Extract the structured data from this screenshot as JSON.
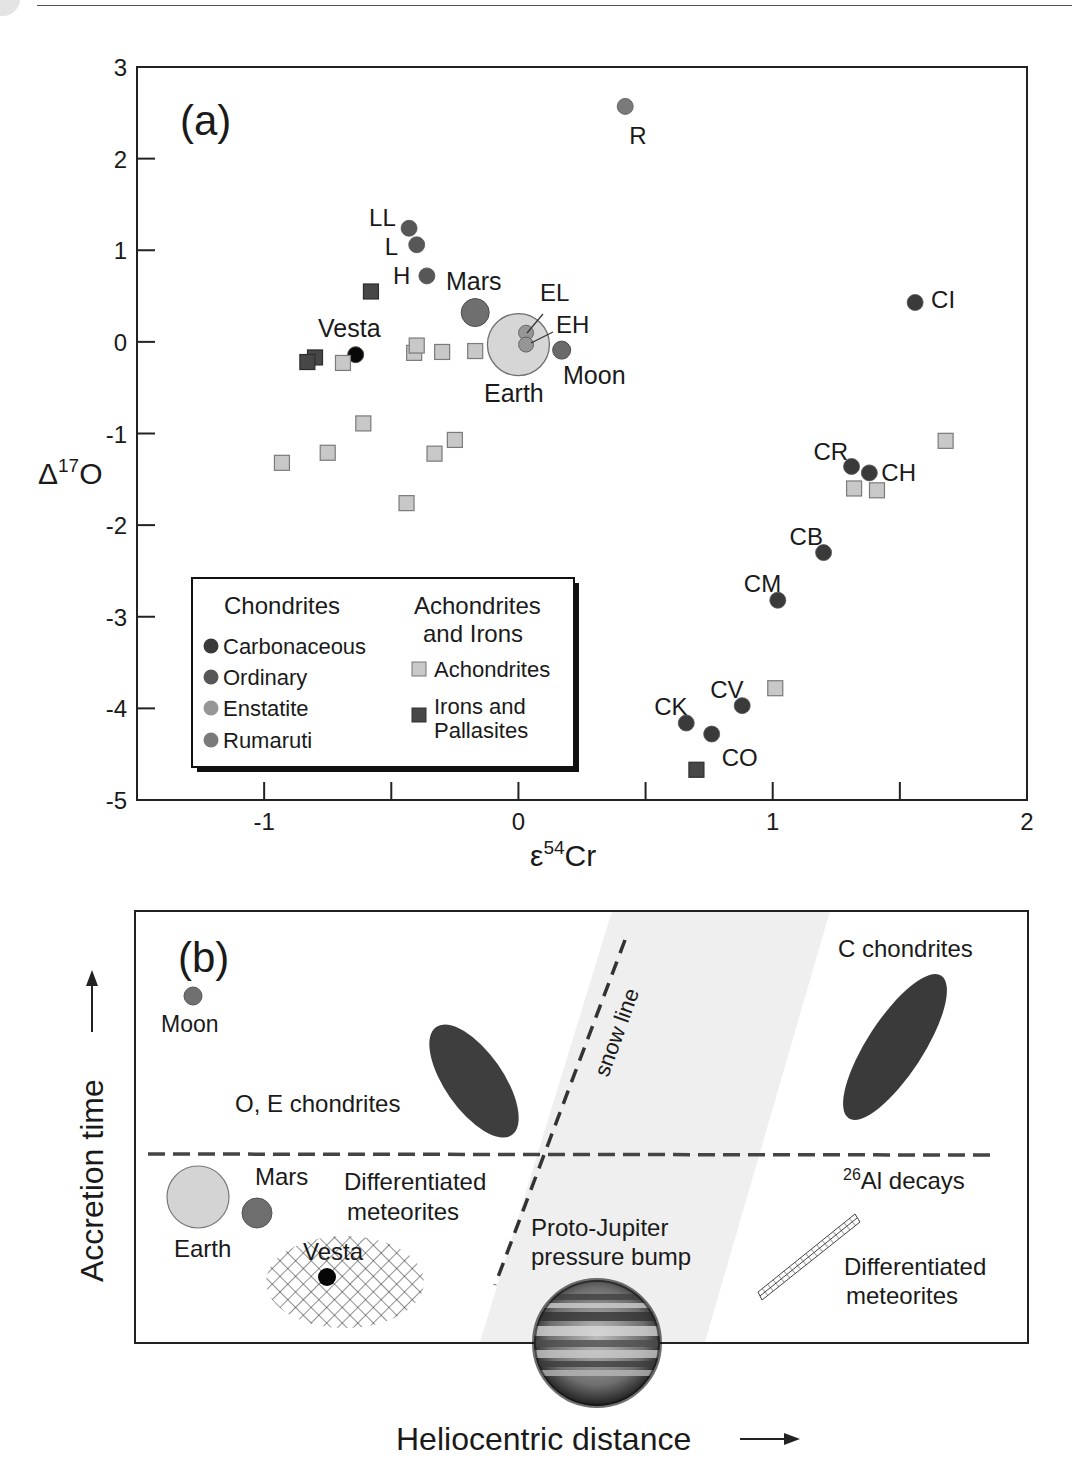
{
  "figure": {
    "panel_a_label": "(a)",
    "panel_b_label": "(b)"
  },
  "chart_data": [
    {
      "type": "scatter",
      "panel": "(a)",
      "title": "",
      "xlabel": "ε54Cr",
      "xlabel_base": "ε",
      "xlabel_sup": "54",
      "xlabel_tail": "Cr",
      "ylabel": "Δ17O",
      "ylabel_base": "Δ",
      "ylabel_sup": "17",
      "ylabel_tail": "O",
      "xlim": [
        -1.5,
        2
      ],
      "ylim": [
        -5,
        3
      ],
      "xticks": [
        -1,
        -0.5,
        0,
        0.5,
        1,
        1.5,
        2
      ],
      "xtick_labels": [
        "-1",
        "",
        "0",
        "",
        "1",
        "",
        "2"
      ],
      "yticks": [
        3,
        2,
        1,
        0,
        -1,
        -2,
        -3,
        -4,
        -5
      ],
      "ytick_labels": [
        "3",
        "2",
        "1",
        "0",
        "-1",
        "-2",
        "-3",
        "-4",
        "-5"
      ],
      "grid": false,
      "legend": {
        "position": "lower-left",
        "col1_title": "Chondrites",
        "col1_items": [
          {
            "label": "Carbonaceous",
            "marker": "circle",
            "color": "#3a3a3a"
          },
          {
            "label": "Ordinary",
            "marker": "circle",
            "color": "#575757"
          },
          {
            "label": "Enstatite",
            "marker": "circle",
            "color": "#969696"
          },
          {
            "label": "Rumaruti",
            "marker": "circle",
            "color": "#7a7a7a"
          }
        ],
        "col2_title_line1": "Achondrites",
        "col2_title_line2": "and Irons",
        "col2_items": [
          {
            "label_line1": "Achondrites",
            "label_line2": "",
            "marker": "square",
            "color": "#c8c8c8"
          },
          {
            "label_line1": "Irons and",
            "label_line2": "Pallasites",
            "marker": "square",
            "color": "#474747"
          }
        ]
      },
      "series": [
        {
          "name": "Carbonaceous",
          "marker": "circle",
          "color": "#3a3a3a",
          "points": [
            {
              "label": "CI",
              "x": 1.56,
              "y": 0.43,
              "lx": 16,
              "ly": -2
            },
            {
              "label": "CR",
              "x": 1.31,
              "y": -1.36,
              "lx": -38,
              "ly": -14
            },
            {
              "label": "CH",
              "x": 1.38,
              "y": -1.43,
              "lx": 12,
              "ly": 0
            },
            {
              "label": "CB",
              "x": 1.2,
              "y": -2.3,
              "lx": -34,
              "ly": -16
            },
            {
              "label": "CM",
              "x": 1.02,
              "y": -2.82,
              "lx": -34,
              "ly": -16
            },
            {
              "label": "CV",
              "x": 0.88,
              "y": -3.97,
              "lx": -32,
              "ly": -16
            },
            {
              "label": "CK",
              "x": 0.66,
              "y": -4.16,
              "lx": -32,
              "ly": -16
            },
            {
              "label": "CO",
              "x": 0.76,
              "y": -4.28,
              "lx": 10,
              "ly": 24
            }
          ]
        },
        {
          "name": "Ordinary",
          "marker": "circle",
          "color": "#575757",
          "points": [
            {
              "label": "LL",
              "x": -0.43,
              "y": 1.24,
              "lx": -40,
              "ly": -10
            },
            {
              "label": "L",
              "x": -0.4,
              "y": 1.06,
              "lx": -32,
              "ly": 2
            },
            {
              "label": "H",
              "x": -0.36,
              "y": 0.72,
              "lx": -34,
              "ly": 0
            }
          ]
        },
        {
          "name": "Enstatite",
          "marker": "circle",
          "color": "#969696",
          "points": [
            {
              "label": "EL",
              "x": 0.03,
              "y": 0.1,
              "lx": 14,
              "ly": -40
            },
            {
              "label": "EH",
              "x": 0.03,
              "y": -0.03,
              "lx": 30,
              "ly": -20
            }
          ]
        },
        {
          "name": "Rumaruti",
          "marker": "circle",
          "color": "#7a7a7a",
          "points": [
            {
              "label": "R",
              "x": 0.42,
              "y": 2.57,
              "lx": 4,
              "ly": 30
            }
          ]
        },
        {
          "name": "Planetary bodies",
          "marker": "circle",
          "points": [
            {
              "label": "Mars",
              "x": -0.17,
              "y": 0.32,
              "r": 14,
              "color": "#6f6f6f"
            },
            {
              "label": "Earth",
              "x": 0.0,
              "y": -0.03,
              "r": 31,
              "color": "#d6d6d6"
            },
            {
              "label": "Moon",
              "x": 0.17,
              "y": -0.09,
              "r": 9,
              "color": "#6a6a6a"
            },
            {
              "label": "Vesta",
              "x": -0.64,
              "y": -0.14,
              "r": 8,
              "color": "#080808"
            }
          ]
        },
        {
          "name": "Achondrites",
          "marker": "square",
          "color": "#c8c8c8",
          "points": [
            {
              "x": -0.69,
              "y": -0.23
            },
            {
              "x": -0.41,
              "y": -0.12
            },
            {
              "x": -0.4,
              "y": -0.04
            },
            {
              "x": -0.3,
              "y": -0.11
            },
            {
              "x": -0.17,
              "y": -0.1
            },
            {
              "x": -0.61,
              "y": -0.89
            },
            {
              "x": -0.93,
              "y": -1.32
            },
            {
              "x": -0.75,
              "y": -1.21
            },
            {
              "x": -0.33,
              "y": -1.22
            },
            {
              "x": -0.25,
              "y": -1.07
            },
            {
              "x": -0.44,
              "y": -1.76
            },
            {
              "x": 1.32,
              "y": -1.6
            },
            {
              "x": 1.41,
              "y": -1.62
            },
            {
              "x": 1.68,
              "y": -1.08
            },
            {
              "x": 1.01,
              "y": -3.78
            }
          ]
        },
        {
          "name": "Irons and Pallasites",
          "marker": "square",
          "color": "#474747",
          "points": [
            {
              "x": -0.58,
              "y": 0.55
            },
            {
              "x": -0.8,
              "y": -0.17
            },
            {
              "x": -0.83,
              "y": -0.22
            },
            {
              "x": 0.7,
              "y": -4.67
            }
          ]
        }
      ]
    },
    {
      "type": "diagram",
      "panel": "(b)",
      "xlabel": "Heliocentric distance",
      "ylabel": "Accretion time",
      "annotations": {
        "moon": "Moon",
        "oe_chondrites": "O, E chondrites",
        "c_chondrites": "C chondrites",
        "snow_line": "snow line",
        "al_decays_sup": "26",
        "al_decays_text": "Al decays",
        "earth": "Earth",
        "mars": "Mars",
        "diff_meteorites_inner_line1": "Differentiated",
        "diff_meteorites_inner_line2": "meteorites",
        "vesta": "Vesta",
        "proto_jupiter_line1": "Proto-Jupiter",
        "proto_jupiter_line2": "pressure bump",
        "diff_meteorites_outer_line1": "Differentiated",
        "diff_meteorites_outer_line2": "meteorites"
      }
    }
  ]
}
